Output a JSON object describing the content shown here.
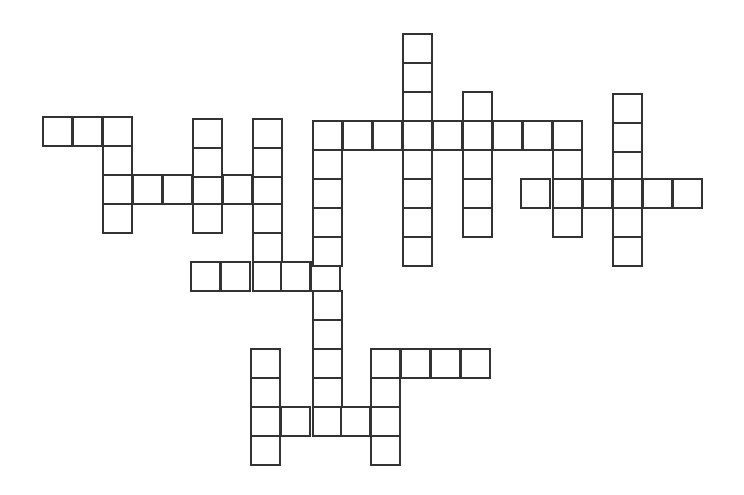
{
  "puzzle": {
    "type": "crossword",
    "cell_size": 29,
    "border_color": "#333333",
    "background": "#ffffff",
    "cells": [
      [
        42,
        116
      ],
      [
        72,
        116
      ],
      [
        102,
        116
      ],
      [
        102,
        145
      ],
      [
        102,
        174
      ],
      [
        102,
        203
      ],
      [
        132,
        174
      ],
      [
        162,
        174
      ],
      [
        192,
        174
      ],
      [
        222,
        174
      ],
      [
        252,
        174
      ],
      [
        192,
        118
      ],
      [
        192,
        147
      ],
      [
        192,
        203
      ],
      [
        252,
        118
      ],
      [
        252,
        147
      ],
      [
        252,
        203
      ],
      [
        252,
        232
      ],
      [
        252,
        261
      ],
      [
        190,
        261
      ],
      [
        220,
        261
      ],
      [
        280,
        261
      ],
      [
        310,
        261
      ],
      [
        312,
        120
      ],
      [
        342,
        120
      ],
      [
        372,
        120
      ],
      [
        402,
        120
      ],
      [
        432,
        120
      ],
      [
        462,
        120
      ],
      [
        492,
        120
      ],
      [
        522,
        120
      ],
      [
        552,
        120
      ],
      [
        312,
        149
      ],
      [
        312,
        178
      ],
      [
        312,
        207
      ],
      [
        312,
        236
      ],
      [
        312,
        290
      ],
      [
        312,
        319
      ],
      [
        312,
        348
      ],
      [
        312,
        377
      ],
      [
        312,
        406
      ],
      [
        402,
        33
      ],
      [
        402,
        62
      ],
      [
        402,
        91
      ],
      [
        402,
        149
      ],
      [
        402,
        178
      ],
      [
        402,
        207
      ],
      [
        402,
        236
      ],
      [
        462,
        91
      ],
      [
        462,
        149
      ],
      [
        462,
        178
      ],
      [
        462,
        207
      ],
      [
        552,
        149
      ],
      [
        552,
        178
      ],
      [
        552,
        207
      ],
      [
        520,
        178
      ],
      [
        582,
        178
      ],
      [
        642,
        178
      ],
      [
        672,
        178
      ],
      [
        612,
        93
      ],
      [
        612,
        122
      ],
      [
        612,
        151
      ],
      [
        612,
        178
      ],
      [
        612,
        207
      ],
      [
        612,
        236
      ],
      [
        250,
        348
      ],
      [
        250,
        377
      ],
      [
        250,
        406
      ],
      [
        250,
        435
      ],
      [
        280,
        406
      ],
      [
        340,
        406
      ],
      [
        370,
        348
      ],
      [
        370,
        377
      ],
      [
        370,
        406
      ],
      [
        370,
        435
      ],
      [
        400,
        348
      ],
      [
        430,
        348
      ],
      [
        460,
        348
      ]
    ]
  }
}
